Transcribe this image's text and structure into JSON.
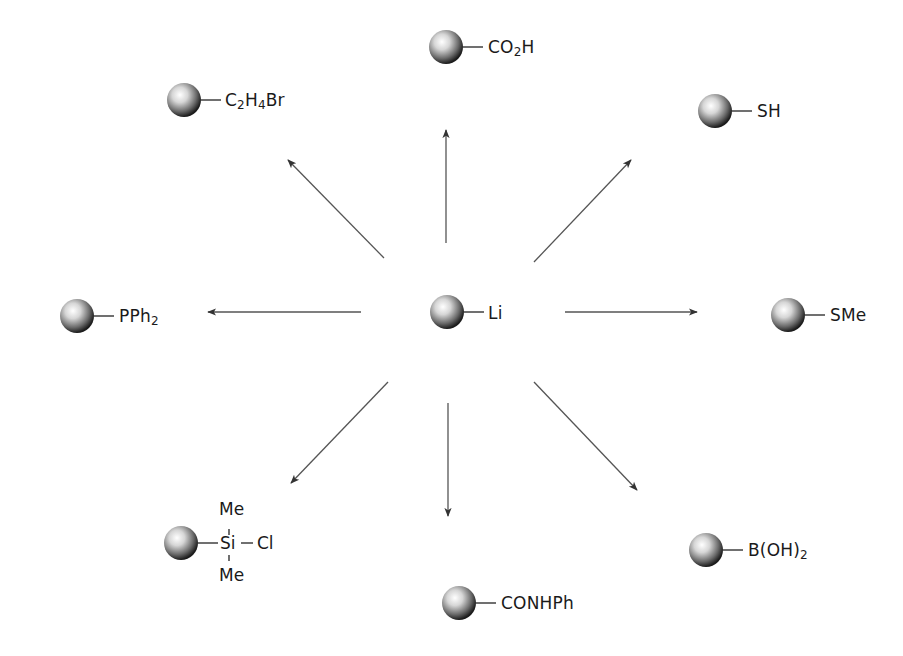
{
  "diagram": {
    "type": "reaction-scheme",
    "center": {
      "label": "Li",
      "sphere": {
        "cx": 447,
        "cy": 312,
        "r": 17
      },
      "label_x": 488,
      "label_y": 303
    },
    "products": [
      {
        "id": "co2h",
        "main": "CO",
        "sub": "2",
        "tail": "H",
        "sphere": {
          "cx": 446,
          "cy": 47,
          "r": 17
        },
        "label_x": 488,
        "label_y": 37
      },
      {
        "id": "c2h4br",
        "parts": [
          "C",
          "2",
          "H",
          "4",
          "Br"
        ],
        "sphere": {
          "cx": 184,
          "cy": 100,
          "r": 17
        },
        "label_x": 225,
        "label_y": 90
      },
      {
        "id": "sh",
        "main": "SH",
        "sphere": {
          "cx": 715,
          "cy": 111,
          "r": 17
        },
        "label_x": 757,
        "label_y": 101
      },
      {
        "id": "pph2",
        "main": "PPh",
        "sub": "2",
        "tail": "",
        "sphere": {
          "cx": 77,
          "cy": 316,
          "r": 17
        },
        "label_x": 119,
        "label_y": 306
      },
      {
        "id": "sme",
        "main": "SMe",
        "sphere": {
          "cx": 788,
          "cy": 315,
          "r": 17
        },
        "label_x": 830,
        "label_y": 305
      },
      {
        "id": "sime2cl",
        "center_atom": "Si",
        "right": "Cl",
        "top": "Me",
        "bottom": "Me",
        "sphere": {
          "cx": 181,
          "cy": 543,
          "r": 17
        }
      },
      {
        "id": "conhph",
        "main": "CONHPh",
        "sphere": {
          "cx": 459,
          "cy": 603,
          "r": 17
        },
        "label_x": 501,
        "label_y": 593
      },
      {
        "id": "boh2",
        "main": "B(OH)",
        "sub": "2",
        "tail": "",
        "sphere": {
          "cx": 706,
          "cy": 550,
          "r": 17
        },
        "label_x": 748,
        "label_y": 540
      }
    ],
    "arrows": [
      {
        "x1": 446,
        "y1": 243,
        "x2": 446,
        "y2": 130
      },
      {
        "x1": 384,
        "y1": 258,
        "x2": 288,
        "y2": 160
      },
      {
        "x1": 534,
        "y1": 262,
        "x2": 631,
        "y2": 160
      },
      {
        "x1": 361,
        "y1": 312,
        "x2": 208,
        "y2": 312
      },
      {
        "x1": 565,
        "y1": 312,
        "x2": 697,
        "y2": 312
      },
      {
        "x1": 388,
        "y1": 382,
        "x2": 291,
        "y2": 483
      },
      {
        "x1": 448,
        "y1": 403,
        "x2": 448,
        "y2": 516
      },
      {
        "x1": 534,
        "y1": 382,
        "x2": 637,
        "y2": 490
      }
    ],
    "colors": {
      "line": "#555555",
      "arrowhead": "#333333",
      "text": "#1a1a1a"
    }
  }
}
